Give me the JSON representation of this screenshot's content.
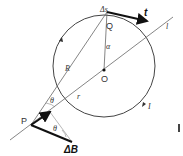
{
  "diagram": {
    "colors": {
      "line": "#555555",
      "thick": "#111111",
      "thin": "#888888"
    },
    "labels": {
      "delta_s": "Δs",
      "t": "t",
      "l": "l",
      "Q": "Q",
      "alpha": "α",
      "R": "R",
      "O": "O",
      "r": "r",
      "theta_top": "θ",
      "theta_bottom": "θ",
      "P": "P",
      "I": "I",
      "delta_B": "ΔB"
    }
  }
}
